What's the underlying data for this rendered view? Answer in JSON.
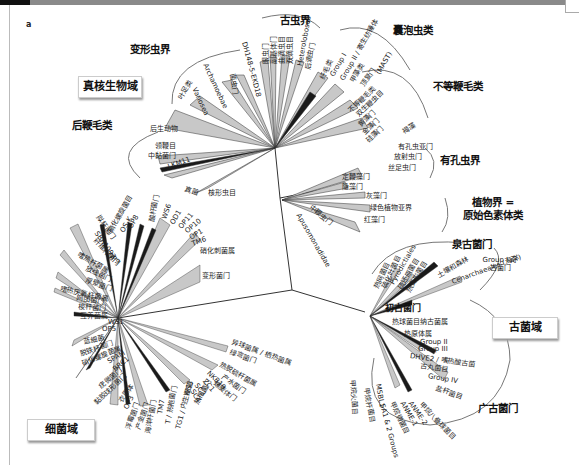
{
  "panel_label": "a",
  "domains": {
    "eukaryota": "真核生物域",
    "bacteria": "细菌域",
    "archaea": "古菌域"
  },
  "supergroups": {
    "amoebozoa": "变形虫界",
    "excavata": "古虫界",
    "alveolata": "囊泡虫类",
    "stramenopiles": "不等鞭毛类",
    "opisthokonta": "后鞭毛类",
    "rhizaria": "有孔虫界",
    "plantae": "植物界 =\n原始色素体类",
    "korarchaeota": "泉古菌门",
    "euryarchaeota": "广古菌门",
    "nanoarchaeota": "初古菌门"
  },
  "eukaryote_labels": {
    "opisthokonta": [
      "后生动物",
      "领鞭目",
      "中黏菌门",
      "LKM11",
      "真菌",
      "核形虫目"
    ],
    "amoebozoa": [
      "叶足类",
      "Variosea",
      "Archamoebae",
      "菌虫门"
    ],
    "excavata": [
      "DH148-5-EKD18",
      "眼虫门",
      "副基体门",
      "曲滴虫目",
      "双滴虫目",
      "Heterolobosea",
      "后滴虫门"
    ],
    "alveolata": [
      "纤毛类",
      "Group I",
      "Group II / 寄生纺锤体",
      "甲藻类",
      "顶复门"
    ],
    "stramenopiles": [
      "(MAST)",
      "褐藻",
      "不等鞭毛类",
      "双生鞭虫目",
      "黄藻门",
      "金藻门",
      "硅藻门"
    ],
    "rhizaria": [
      "有孔虫亚门",
      "放射虫门",
      "丝足虫门"
    ],
    "misc": [
      "定鞭藻门",
      "隐藻门",
      "中鞭虫门",
      "Apusomonadidae"
    ],
    "plantae": [
      "灰藻门",
      "绿色植物亚界",
      "红藻门"
    ]
  },
  "bacteria_labels": {
    "upper": [
      "OP8",
      "OS-K",
      "硝化螺旋菌目",
      "酸杆菌门",
      "WS6",
      "OD1",
      "OP11",
      "OP10",
      "OP1",
      "TM6",
      "硝化刺菌属",
      "变形菌门"
    ],
    "left": [
      "拟杆菌门",
      "SBR1093",
      "纤维杆菌门",
      "OP9",
      "嗜热杆菌属",
      "放线菌门",
      "厚壁菌门",
      "嗜热厌氧杆菌属",
      "网团菌门",
      "梭杆菌门",
      "互养菌属",
      "WS1",
      "OP5",
      "蓝细菌",
      "脱铁杆菌门",
      "硝化螺旋菌属",
      "SPAM",
      "BRC1",
      "疣微菌门",
      "黏胶球形菌门",
      "衣原体"
    ],
    "bottom": [
      "OP3",
      "浮霉菌门",
      "产金菌门",
      "海洋杆菌门",
      "TM7",
      "WS3",
      "T / 热袍菌门",
      "TG1 / 内生细菌",
      "热袍菌门"
    ],
    "right": [
      "异球菌属 / 栖热菌属",
      "绿弯菌门",
      "热脱硫杆菌属",
      "产水菌门",
      "螺旋体门",
      "NKB19",
      "ZC1",
      "SC3",
      "SC4"
    ]
  },
  "archaea_labels": {
    "crenarchaeota": [
      "热网菌目",
      "硫化叶菌目",
      "Pyrodictiales",
      "硫还原菌目",
      "热变形菌目",
      "土壤和森林",
      "Group I 奇古菌门",
      "Cenarchaeales (海洋)"
    ],
    "euryarchaeota": [
      "热球菌目纳古菌属",
      "热原体属",
      "Group II",
      "Group III",
      "DHVE2 / 嗜热酸古菌",
      "古丸菌目",
      "Group IV",
      "盐杆菌目",
      "甲烷八叠球菌目",
      "ANME-2",
      "ANME-1",
      "甲烷微菌目",
      "SA1 & 2 Groups",
      "MSBL1",
      "甲烷杆菌目",
      "甲烷火菌目"
    ]
  },
  "colors": {
    "branch": "#333333",
    "wedge_fill": "#c8c8c8",
    "wedge_dark": "#1a1a1a",
    "arc": "#555555",
    "topbar": "#8a8a8a"
  }
}
